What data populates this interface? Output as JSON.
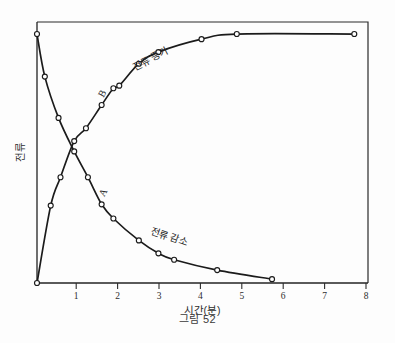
{
  "figure": {
    "caption": "그림 52",
    "x_axis_title": "시간(분)",
    "y_axis_title": "전류"
  },
  "annotations": {
    "rising_curve_label": "전류 증가",
    "decay_curve_label": "전류 감소",
    "point_a_label": "A",
    "point_b_label": "B"
  },
  "chart_data": {
    "type": "line",
    "title": "그림 52",
    "xlabel": "시간(분)",
    "ylabel": "전류",
    "xlim": [
      0,
      8.45
    ],
    "ylim": [
      0,
      1
    ],
    "grid": false,
    "legend": "inline-curve-labels",
    "xticks": [
      "1",
      "2",
      "3",
      "4",
      "5",
      "6",
      "7",
      "8"
    ],
    "xtick_values": [
      1,
      2,
      3,
      4,
      5,
      6,
      7,
      8
    ],
    "yticks": [],
    "series": [
      {
        "name": "전류 증가",
        "annotation_label": "B",
        "x": [
          0.0,
          0.35,
          0.6,
          0.95,
          1.25,
          1.65,
          1.95,
          2.1,
          2.6,
          3.1,
          4.2,
          5.1,
          8.1
        ],
        "y": [
          0.0,
          0.3,
          0.41,
          0.55,
          0.6,
          0.69,
          0.755,
          0.765,
          0.85,
          0.895,
          0.945,
          0.965,
          0.965
        ]
      },
      {
        "name": "전류 감소",
        "annotation_label": "A",
        "x": [
          0.0,
          0.2,
          0.55,
          0.95,
          1.3,
          1.65,
          1.95,
          2.6,
          3.1,
          3.5,
          4.6,
          6.0
        ],
        "y": [
          0.965,
          0.8,
          0.64,
          0.51,
          0.41,
          0.305,
          0.25,
          0.165,
          0.115,
          0.09,
          0.05,
          0.015
        ]
      }
    ]
  }
}
